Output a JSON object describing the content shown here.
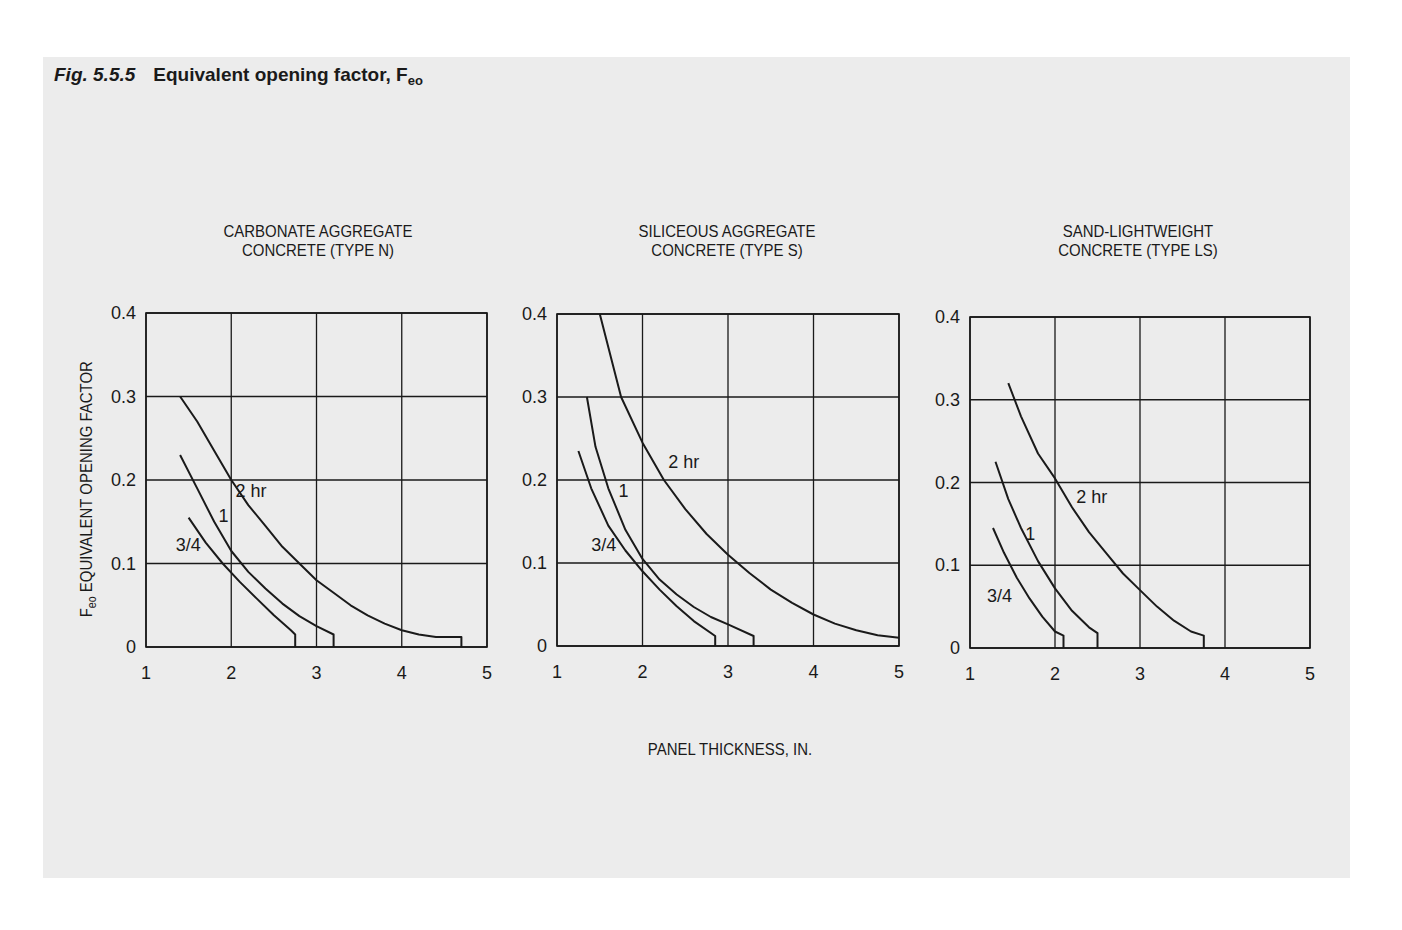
{
  "figure": {
    "number": "Fig. 5.5.5",
    "title": "Equivalent opening factor, F",
    "title_subscript": "eo",
    "xlabel": "PANEL THICKNESS, IN.",
    "ylabel_main": "F",
    "ylabel_sub": "eo",
    "ylabel_rest": " EQUIVALENT OPENING FACTOR",
    "background": "#ececec",
    "line_color": "#1a1a1a"
  },
  "chart_data": [
    {
      "type": "line",
      "title": "CARBONATE AGGREGATE\nCONCRETE (TYPE N)",
      "xlabel": "PANEL THICKNESS, IN.",
      "ylabel": "Feo EQUIVALENT OPENING FACTOR",
      "xlim": [
        1,
        5
      ],
      "ylim": [
        0,
        0.4
      ],
      "xticks": [
        1,
        2,
        3,
        4,
        5
      ],
      "yticks": [
        0,
        0.1,
        0.2,
        0.3,
        0.4
      ],
      "grid": true,
      "series": [
        {
          "name": "2 hr",
          "x": [
            1.4,
            1.6,
            1.8,
            2.0,
            2.2,
            2.4,
            2.6,
            2.8,
            3.0,
            3.2,
            3.4,
            3.6,
            3.8,
            4.0,
            4.2,
            4.4,
            4.7,
            4.7
          ],
          "y": [
            0.3,
            0.27,
            0.235,
            0.2,
            0.17,
            0.145,
            0.12,
            0.1,
            0.08,
            0.065,
            0.05,
            0.038,
            0.028,
            0.02,
            0.015,
            0.012,
            0.012,
            0
          ]
        },
        {
          "name": "1",
          "x": [
            1.4,
            1.6,
            1.8,
            2.0,
            2.2,
            2.4,
            2.6,
            2.8,
            3.0,
            3.2,
            3.2
          ],
          "y": [
            0.23,
            0.19,
            0.15,
            0.115,
            0.09,
            0.07,
            0.052,
            0.037,
            0.025,
            0.015,
            0
          ]
        },
        {
          "name": "3/4",
          "x": [
            1.5,
            1.7,
            1.9,
            2.1,
            2.3,
            2.5,
            2.7,
            2.75,
            2.75
          ],
          "y": [
            0.155,
            0.125,
            0.1,
            0.078,
            0.058,
            0.038,
            0.02,
            0.015,
            0
          ]
        }
      ],
      "annotations": [
        {
          "text": "2 hr",
          "x": 2.05,
          "y": 0.18
        },
        {
          "text": "1",
          "x": 1.85,
          "y": 0.15
        },
        {
          "text": "3/4",
          "x": 1.35,
          "y": 0.115
        }
      ]
    },
    {
      "type": "line",
      "title": "SILICEOUS AGGREGATE\nCONCRETE (TYPE S)",
      "xlabel": "PANEL THICKNESS, IN.",
      "ylabel": "",
      "xlim": [
        1,
        5
      ],
      "ylim": [
        0,
        0.4
      ],
      "xticks": [
        1,
        2,
        3,
        4,
        5
      ],
      "yticks": [
        0,
        0.1,
        0.2,
        0.3,
        0.4
      ],
      "grid": true,
      "series": [
        {
          "name": "2 hr",
          "x": [
            1.5,
            1.75,
            2.0,
            2.25,
            2.5,
            2.75,
            3.0,
            3.25,
            3.5,
            3.75,
            4.0,
            4.25,
            4.5,
            4.75,
            5.0
          ],
          "y": [
            0.4,
            0.3,
            0.245,
            0.2,
            0.165,
            0.135,
            0.11,
            0.088,
            0.068,
            0.052,
            0.038,
            0.027,
            0.019,
            0.013,
            0.01
          ]
        },
        {
          "name": "1",
          "x": [
            1.35,
            1.45,
            1.6,
            1.8,
            2.0,
            2.2,
            2.4,
            2.6,
            2.8,
            3.0,
            3.3,
            3.3
          ],
          "y": [
            0.3,
            0.24,
            0.19,
            0.14,
            0.105,
            0.08,
            0.062,
            0.047,
            0.035,
            0.026,
            0.012,
            0
          ]
        },
        {
          "name": "3/4",
          "x": [
            1.25,
            1.4,
            1.6,
            1.8,
            2.0,
            2.2,
            2.4,
            2.6,
            2.85,
            2.85
          ],
          "y": [
            0.235,
            0.19,
            0.145,
            0.115,
            0.09,
            0.068,
            0.048,
            0.03,
            0.012,
            0
          ]
        }
      ],
      "annotations": [
        {
          "text": "2 hr",
          "x": 2.3,
          "y": 0.215
        },
        {
          "text": "1",
          "x": 1.72,
          "y": 0.18
        },
        {
          "text": "3/4",
          "x": 1.4,
          "y": 0.115
        }
      ]
    },
    {
      "type": "line",
      "title": "SAND-LIGHTWEIGHT\nCONCRETE (TYPE LS)",
      "xlabel": "PANEL THICKNESS, IN.",
      "ylabel": "",
      "xlim": [
        1,
        5
      ],
      "ylim": [
        0,
        0.4
      ],
      "xticks": [
        1,
        2,
        3,
        4,
        5
      ],
      "yticks": [
        0,
        0.1,
        0.2,
        0.3,
        0.4
      ],
      "grid": true,
      "series": [
        {
          "name": "2 hr",
          "x": [
            1.45,
            1.6,
            1.8,
            2.0,
            2.2,
            2.4,
            2.6,
            2.8,
            3.0,
            3.2,
            3.4,
            3.6,
            3.75,
            3.75
          ],
          "y": [
            0.32,
            0.28,
            0.235,
            0.205,
            0.17,
            0.14,
            0.115,
            0.09,
            0.07,
            0.05,
            0.033,
            0.02,
            0.015,
            0
          ]
        },
        {
          "name": "1",
          "x": [
            1.3,
            1.45,
            1.6,
            1.8,
            2.0,
            2.2,
            2.4,
            2.5,
            2.5
          ],
          "y": [
            0.225,
            0.18,
            0.145,
            0.105,
            0.072,
            0.045,
            0.025,
            0.018,
            0
          ]
        },
        {
          "name": "3/4",
          "x": [
            1.27,
            1.4,
            1.55,
            1.7,
            1.85,
            2.0,
            2.1,
            2.1
          ],
          "y": [
            0.145,
            0.115,
            0.085,
            0.06,
            0.038,
            0.02,
            0.015,
            0
          ]
        }
      ],
      "annotations": [
        {
          "text": "2 hr",
          "x": 2.25,
          "y": 0.175
        },
        {
          "text": "1",
          "x": 1.65,
          "y": 0.13
        },
        {
          "text": "3/4",
          "x": 1.2,
          "y": 0.055
        }
      ]
    }
  ]
}
